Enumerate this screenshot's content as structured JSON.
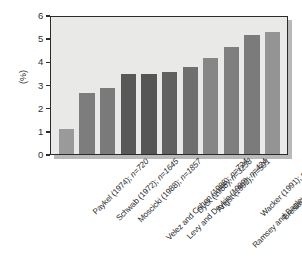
{
  "chart_data": {
    "type": "bar",
    "title": "",
    "subtitle": "",
    "xlabel": "",
    "ylabel": "(%)",
    "ylim": [
      0,
      6
    ],
    "yticks": [
      "0",
      "1",
      "2",
      "3",
      "4",
      "5",
      "6"
    ],
    "grid": false,
    "legend": false,
    "orientation": "vertical",
    "xtick_rotation": -45,
    "categories": [
      "Paykel (1974); n=720",
      "Schwab (1972); n=1645",
      "Moscicki (1988); n=1857",
      "Velez and Cohen (1988); n=724",
      "Levy and Deykin (1989); n=424",
      "Dyck (1988); n=3258",
      "Angst (1992); n=591",
      "Ramsey and Bagley (1985); n=679",
      "Wacker (1991); n=470",
      "Breslau (1991); n=1007",
      "Schepank (1987); n=600"
    ],
    "studies": [
      {
        "author": "Paykel",
        "year": "1974",
        "n": "720",
        "value": 1.1,
        "color": "#9a9a9a"
      },
      {
        "author": "Schwab",
        "year": "1972",
        "n": "1645",
        "value": 2.65,
        "color": "#7d7d7d"
      },
      {
        "author": "Moscicki",
        "year": "1988",
        "n": "1857",
        "value": 2.85,
        "color": "#7a7a7a"
      },
      {
        "author": "Velez and Cohen",
        "year": "1988",
        "n": "724",
        "value": 3.45,
        "color": "#585858"
      },
      {
        "author": "Levy and Deykin",
        "year": "1989",
        "n": "424",
        "value": 3.45,
        "color": "#555555"
      },
      {
        "author": "Dyck",
        "year": "1988",
        "n": "3258",
        "value": 3.55,
        "color": "#606060"
      },
      {
        "author": "Angst",
        "year": "1992",
        "n": "591",
        "value": 3.75,
        "color": "#6f6f6f"
      },
      {
        "author": "Ramsey and Bagley",
        "year": "1985",
        "n": "679",
        "value": 4.15,
        "color": "#868686"
      },
      {
        "author": "Wacker",
        "year": "1991",
        "n": "470",
        "value": 4.6,
        "color": "#7f7f7f"
      },
      {
        "author": "Breslau",
        "year": "1991",
        "n": "1007",
        "value": 5.15,
        "color": "#7b7b7b"
      },
      {
        "author": "Schepank",
        "year": "1987",
        "n": "600",
        "value": 5.25,
        "color": "#949494"
      }
    ],
    "values": [
      1.1,
      2.65,
      2.85,
      3.45,
      3.45,
      3.55,
      3.75,
      4.15,
      4.6,
      5.15,
      5.25
    ],
    "colors": {
      "plot_background": "#e9e9e7",
      "frame": "#2b2b2b",
      "shadow": "#b9b9b9",
      "page_background": "#ffffff",
      "text": "#2b2b2b"
    }
  }
}
